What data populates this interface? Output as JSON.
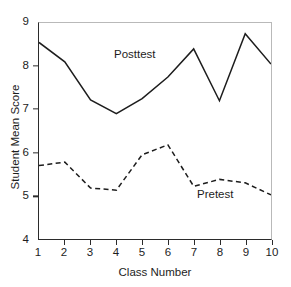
{
  "chart_data": {
    "type": "line",
    "title": "",
    "xlabel": "Class Number",
    "ylabel": "Student Mean Score",
    "x": [
      1,
      2,
      3,
      4,
      5,
      6,
      7,
      8,
      9,
      10
    ],
    "xlim": [
      1,
      10
    ],
    "ylim": [
      4,
      9
    ],
    "xticks": [
      "1",
      "2",
      "3",
      "4",
      "5",
      "6",
      "7",
      "8",
      "9",
      "10"
    ],
    "yticks": [
      "4",
      "5",
      "6",
      "7",
      "8",
      "9"
    ],
    "grid": false,
    "legend": "inline-annotations",
    "series": [
      {
        "name": "Posttest",
        "style": "solid",
        "color": "#1d1d1d",
        "values": [
          8.55,
          8.1,
          7.22,
          6.9,
          7.25,
          7.75,
          8.4,
          7.2,
          8.75,
          8.05
        ]
      },
      {
        "name": "Pretest",
        "style": "dashed",
        "color": "#1d1d1d",
        "values": [
          5.7,
          5.78,
          5.18,
          5.13,
          5.95,
          6.18,
          5.22,
          5.38,
          5.3,
          5.02
        ]
      }
    ],
    "annotations": [
      {
        "text": "Posttest",
        "series": "Posttest"
      },
      {
        "text": "Pretest",
        "series": "Pretest"
      }
    ]
  },
  "axis": {
    "y_title": "Student Mean Score",
    "x_title": "Class Number"
  },
  "colors": {
    "ink": "#1d1d1d",
    "axis": "#2b2b2b",
    "frame_light": "#b9b9b9",
    "background": "#ffffff"
  }
}
